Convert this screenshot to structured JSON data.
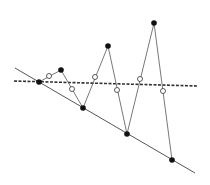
{
  "diagram": {
    "width": 210,
    "height": 185,
    "colors": {
      "background": "#ffffff",
      "line": "#555555",
      "dashed": "#333333",
      "filled_point": "#111111",
      "open_point_fill": "#ffffff",
      "open_point_stroke": "#333333"
    },
    "solid_line": {
      "x1": 15,
      "y1": 68,
      "x2": 195,
      "y2": 173
    },
    "dashed_line": {
      "x1": 14,
      "y1": 81,
      "x2": 198,
      "y2": 86
    },
    "zigzag_points": [
      [
        39,
        82
      ],
      [
        61,
        70
      ],
      [
        83,
        108
      ],
      [
        108,
        46
      ],
      [
        127,
        134
      ],
      [
        154,
        23
      ],
      [
        172,
        160
      ]
    ],
    "filled_points": [
      [
        39,
        82
      ],
      [
        61,
        70
      ],
      [
        83,
        108
      ],
      [
        108,
        46
      ],
      [
        127,
        134
      ],
      [
        154,
        23
      ],
      [
        172,
        160
      ]
    ],
    "open_points": [
      [
        49,
        76
      ],
      [
        72,
        89
      ],
      [
        95,
        77
      ],
      [
        117,
        90
      ],
      [
        140,
        79
      ],
      [
        163,
        91
      ]
    ]
  }
}
